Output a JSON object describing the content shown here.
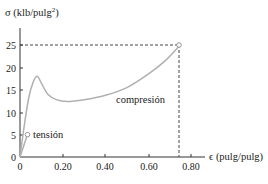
{
  "chart_data": {
    "type": "line",
    "title": "",
    "ylabel": "σ (klb/pulg²)",
    "ylabel_base": "σ (klb/pulg",
    "ylabel_sup": "2",
    "ylabel_close": ")",
    "xlabel": "ϵ (pulg/pulg)",
    "xlim": [
      0,
      0.85
    ],
    "ylim": [
      0,
      28
    ],
    "xticks": [
      0,
      0.2,
      0.4,
      0.6,
      0.8
    ],
    "xtick_labels": [
      "0",
      "0.20",
      "0.40",
      "0.60",
      "0.80"
    ],
    "yticks": [
      0,
      5,
      10,
      15,
      20,
      25
    ],
    "ytick_labels": [
      "0",
      "5",
      "10",
      "15",
      "20",
      "25"
    ],
    "grid": false,
    "legend": null,
    "series": [
      {
        "name": "compresión",
        "x": [
          0,
          0.02,
          0.04,
          0.06,
          0.08,
          0.1,
          0.13,
          0.17,
          0.22,
          0.3,
          0.4,
          0.5,
          0.6,
          0.68,
          0.75
        ],
        "y": [
          0,
          7,
          13,
          16.5,
          18,
          16.5,
          14,
          12.8,
          12.4,
          12.8,
          13.8,
          15.5,
          18.5,
          21.5,
          25
        ]
      },
      {
        "name": "tensión",
        "x": [
          0,
          0.035
        ],
        "y": [
          0,
          5
        ]
      }
    ],
    "annotations": [
      {
        "text": "tensión",
        "x": 0.035,
        "y": 5,
        "marker": "open-circle"
      },
      {
        "text": "compresión",
        "x": 0.52,
        "y": 13
      },
      {
        "text": "end-point",
        "x": 0.75,
        "y": 25,
        "marker": "open-circle",
        "dashed_guides": true
      }
    ],
    "colors": {
      "curve": "#b0b0b0",
      "axis": "#333333",
      "guide": "#444444",
      "text": "#222222"
    }
  }
}
